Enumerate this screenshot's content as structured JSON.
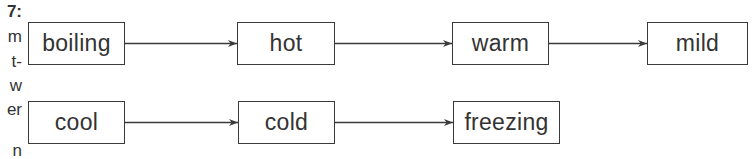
{
  "margin_fragments": [
    "7:",
    "m",
    "t-",
    "w",
    "er",
    "n"
  ],
  "diagram": {
    "rows": [
      {
        "nodes": [
          {
            "id": "boiling",
            "label": "boiling",
            "x": 28,
            "y": 22,
            "w": 97,
            "h": 43
          },
          {
            "id": "hot",
            "label": "hot",
            "x": 237,
            "y": 22,
            "w": 98,
            "h": 43
          },
          {
            "id": "warm",
            "label": "warm",
            "x": 452,
            "y": 22,
            "w": 97,
            "h": 43
          },
          {
            "id": "mild",
            "label": "mild",
            "x": 647,
            "y": 22,
            "w": 101,
            "h": 43
          }
        ]
      },
      {
        "nodes": [
          {
            "id": "cool",
            "label": "cool",
            "x": 28,
            "y": 101,
            "w": 97,
            "h": 43
          },
          {
            "id": "cold",
            "label": "cold",
            "x": 238,
            "y": 101,
            "w": 97,
            "h": 43
          },
          {
            "id": "freezing",
            "label": "freezing",
            "x": 453,
            "y": 101,
            "w": 107,
            "h": 43
          }
        ]
      }
    ],
    "edges": [
      {
        "from": "boiling",
        "to": "hot"
      },
      {
        "from": "hot",
        "to": "warm"
      },
      {
        "from": "warm",
        "to": "mild"
      },
      {
        "from": "cool",
        "to": "cold"
      },
      {
        "from": "cold",
        "to": "freezing"
      }
    ],
    "line_color": "#3a3a3a"
  }
}
